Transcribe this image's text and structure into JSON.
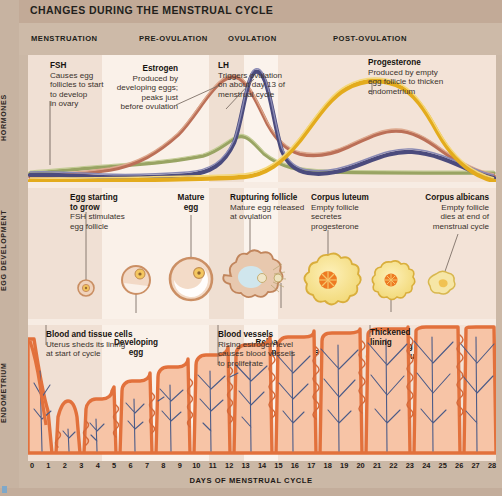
{
  "poster": {
    "title": "CHANGES DURING THE MENSTRUAL CYCLE",
    "axis_caption": "DAYS OF MENSTRUAL CYCLE"
  },
  "phases": [
    {
      "label": "MENSTRUATION",
      "x_pct": 2,
      "start_day": 0,
      "end_day": 5
    },
    {
      "label": "PRE-OVULATION",
      "x_pct": 24.5,
      "start_day": 5,
      "end_day": 12
    },
    {
      "label": "OVULATION",
      "x_pct": 43,
      "start_day": 12,
      "end_day": 16
    },
    {
      "label": "POST-OVULATION",
      "x_pct": 68,
      "start_day": 16,
      "end_day": 28
    }
  ],
  "sections": [
    {
      "id": "hormones",
      "label": "HORMONES"
    },
    {
      "id": "egg-development",
      "label": "EGG DEVELOPMENT"
    },
    {
      "id": "endometrium",
      "label": "ENDOMETRIUM"
    }
  ],
  "hormones": {
    "notes": [
      {
        "id": "fsh",
        "title": "FSH",
        "body": "Causes egg follicles to start to develop in ovary",
        "lines": [
          "Causes egg",
          "follicles to start",
          "to develop",
          "in ovary"
        ]
      },
      {
        "id": "estrogen",
        "title": "Estrogen",
        "body": "Produced by developing eggs; peaks just before ovulation",
        "lines": [
          "Produced by",
          "developing eggs;",
          "peaks just",
          "before ovulation"
        ]
      },
      {
        "id": "lh",
        "title": "LH",
        "body": "Triggers ovulation on about day 13 of menstrual cycle",
        "lines": [
          "Triggers ovulation",
          "on about day 13 of",
          "menstrual cycle"
        ]
      },
      {
        "id": "progesterone",
        "title": "Progesterone",
        "body": "Produced by empty egg follicle to thicken endometrium",
        "lines": [
          "Produced by empty",
          "egg follicle to thicken",
          "endometrium"
        ]
      }
    ],
    "curve_colors": {
      "fsh": "#8f9c5c",
      "estrogen": "#c0705a",
      "lh": "#4a4a7a",
      "progesterone": "#e0a819"
    }
  },
  "egg_development": {
    "notes": [
      {
        "id": "egg-starting-to-grow",
        "title_lines": [
          "Egg starting",
          "to grow"
        ],
        "lines": [
          "FSH stimulates",
          "egg follicle"
        ]
      },
      {
        "id": "developing-egg",
        "title_lines": [
          "Developing",
          "egg"
        ],
        "lines": []
      },
      {
        "id": "mature-egg",
        "title_lines": [
          "Mature",
          "egg"
        ],
        "lines": []
      },
      {
        "id": "rupturing-follicle",
        "title_lines": [
          "Rupturing follicle"
        ],
        "lines": [
          "Mature egg released",
          "at ovulation"
        ]
      },
      {
        "id": "released-egg",
        "title_lines": [
          "Released egg",
          "travelling to uterus"
        ],
        "lines": []
      },
      {
        "id": "corpus-luteum",
        "title_lines": [
          "Corpus luteum"
        ],
        "lines": [
          "Empty follicle",
          "secretes",
          "progesterone"
        ]
      },
      {
        "id": "shrinking-corpus-luteum",
        "title_lines": [
          "Shrinking",
          "corpus luteum"
        ],
        "lines": []
      },
      {
        "id": "corpus-albicans",
        "title_lines": [
          "Corpus albicans"
        ],
        "lines": [
          "Empty follicle",
          "dies at end of",
          "menstrual cycle"
        ]
      }
    ]
  },
  "endometrium": {
    "notes": [
      {
        "id": "blood-and-tissue-cells",
        "title_lines": [
          "Blood and tissue cells"
        ],
        "lines": [
          "Uterus sheds its lining",
          "at start of cycle"
        ]
      },
      {
        "id": "blood-vessels",
        "title_lines": [
          "Blood vessels"
        ],
        "lines": [
          "Rising estrogen level",
          "causes blood vessels",
          "to proliferate"
        ]
      },
      {
        "id": "thickened-lining",
        "title_lines": [
          "Thickened",
          "lining"
        ],
        "lines": []
      }
    ],
    "lining_color": "#f0a582",
    "tissue_fill": "#f6c0a5",
    "vessel_color": "#4a5a86"
  },
  "days": [
    0,
    1,
    2,
    3,
    4,
    5,
    6,
    7,
    8,
    9,
    10,
    11,
    12,
    13,
    14,
    15,
    16,
    17,
    18,
    19,
    20,
    21,
    22,
    23,
    24,
    25,
    26,
    27,
    28
  ],
  "colors": {
    "page_bg": "#cbb8a6",
    "panel_bg": "#f2e4da",
    "title_bar": "#c2aa97",
    "text": "#231f1c"
  },
  "chart_data": {
    "type": "line",
    "xlabel": "DAYS OF MENSTRUAL CYCLE",
    "ylabel": "Relative hormone level",
    "x": [
      0,
      1,
      2,
      3,
      4,
      5,
      6,
      7,
      8,
      9,
      10,
      11,
      12,
      13,
      14,
      15,
      16,
      17,
      18,
      19,
      20,
      21,
      22,
      23,
      24,
      25,
      26,
      27,
      28
    ],
    "xlim": [
      0,
      28
    ],
    "grid": false,
    "legend": "inline annotations",
    "series": [
      {
        "name": "FSH",
        "color": "#8f9c5c",
        "values": [
          22,
          24,
          26,
          27,
          27,
          26,
          24,
          22,
          20,
          19,
          18,
          18,
          20,
          30,
          42,
          30,
          20,
          16,
          14,
          13,
          12,
          12,
          12,
          13,
          14,
          15,
          16,
          17,
          18
        ]
      },
      {
        "name": "Estrogen",
        "color": "#c0705a",
        "values": [
          10,
          10,
          10,
          11,
          12,
          14,
          17,
          22,
          30,
          42,
          58,
          74,
          88,
          94,
          78,
          56,
          44,
          42,
          46,
          52,
          58,
          62,
          64,
          62,
          56,
          46,
          34,
          22,
          14
        ]
      },
      {
        "name": "LH",
        "color": "#4a4a7a",
        "values": [
          14,
          14,
          14,
          14,
          14,
          14,
          15,
          16,
          17,
          18,
          20,
          28,
          60,
          95,
          62,
          26,
          18,
          16,
          18,
          22,
          28,
          34,
          38,
          38,
          34,
          28,
          22,
          16,
          12
        ]
      },
      {
        "name": "Progesterone",
        "color": "#e0a819",
        "values": [
          8,
          8,
          8,
          8,
          8,
          8,
          8,
          8,
          8,
          8,
          8,
          9,
          10,
          12,
          18,
          34,
          56,
          78,
          92,
          98,
          99,
          96,
          88,
          74,
          56,
          38,
          22,
          12,
          8
        ]
      }
    ]
  }
}
